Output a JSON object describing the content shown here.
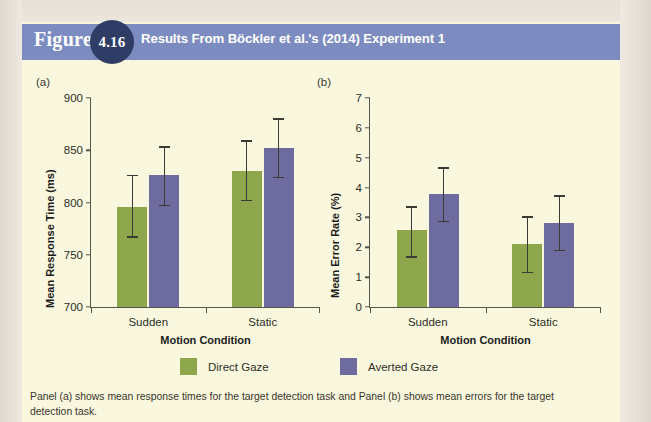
{
  "figure": {
    "label_word": "Figure",
    "number": "4.16",
    "title": "Results From Böckler et al.'s (2014) Experiment 1",
    "caption": "Panel (a) shows mean response times for the target detection task and Panel (b) shows mean errors for the target detection task.",
    "header_color": "#7c8cc0",
    "badge_color": "#2f3d66",
    "body_color": "#f9f7dd"
  },
  "legend": {
    "items": [
      {
        "label": "Direct Gaze",
        "color": "#8ea74d",
        "key": "direct"
      },
      {
        "label": "Averted Gaze",
        "color": "#6e6c9e",
        "key": "averted"
      }
    ]
  },
  "chart_data": [
    {
      "panel": "a",
      "tag": "(a)",
      "type": "bar",
      "title": "",
      "xlabel": "Motion Condition",
      "ylabel": "Mean Response Time (ms)",
      "categories": [
        "Sudden",
        "Static"
      ],
      "ylim": [
        700,
        900
      ],
      "yticks": [
        700,
        750,
        800,
        850,
        900
      ],
      "ytick_labels": [
        "700",
        "750",
        "800",
        "850",
        "900"
      ],
      "grid": false,
      "legend_position": "below",
      "series": [
        {
          "name": "Direct Gaze",
          "color": "#8ea74d",
          "values": [
            796,
            830
          ],
          "err_low": [
            767,
            802
          ],
          "err_high": [
            826,
            859
          ]
        },
        {
          "name": "Averted Gaze",
          "color": "#6e6c9e",
          "values": [
            826,
            852
          ],
          "err_low": [
            797,
            824
          ],
          "err_high": [
            853,
            880
          ]
        }
      ]
    },
    {
      "panel": "b",
      "tag": "(b)",
      "type": "bar",
      "title": "",
      "xlabel": "Motion Condition",
      "ylabel": "Mean Error Rate (%)",
      "categories": [
        "Sudden",
        "Static"
      ],
      "ylim": [
        0,
        7
      ],
      "yticks": [
        0,
        1,
        2,
        3,
        4,
        5,
        6,
        7
      ],
      "ytick_labels": [
        "0",
        "1",
        "2",
        "3",
        "4",
        "5",
        "6",
        "7"
      ],
      "grid": false,
      "legend_position": "below",
      "series": [
        {
          "name": "Direct Gaze",
          "color": "#8ea74d",
          "values": [
            2.57,
            2.1
          ],
          "err_low": [
            1.68,
            1.15
          ],
          "err_high": [
            3.35,
            3.02
          ]
        },
        {
          "name": "Averted Gaze",
          "color": "#6e6c9e",
          "values": [
            3.78,
            2.81
          ],
          "err_low": [
            2.87,
            1.9
          ],
          "err_high": [
            4.66,
            3.72
          ]
        }
      ]
    }
  ]
}
